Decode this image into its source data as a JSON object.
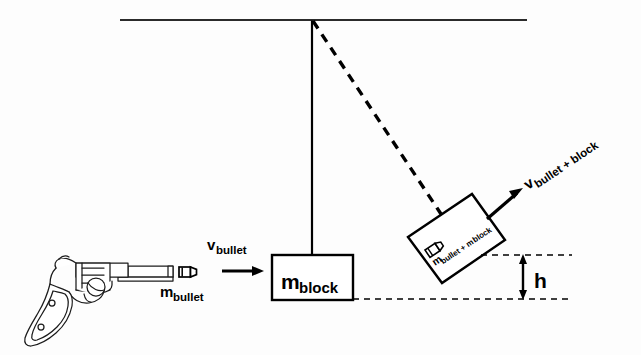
{
  "figure": {
    "background_color": "#fdfdfd",
    "ink_color": "#000000"
  },
  "labels": {
    "v_bullet": {
      "main": "v",
      "sub": "bullet"
    },
    "m_bullet": {
      "main": "m",
      "sub": "bullet"
    },
    "m_block": {
      "main": "m",
      "sub": "block"
    },
    "m_combined": {
      "main": "m",
      "sub": "bullet + m",
      "sub2": "block"
    },
    "v_combined": {
      "main": "v",
      "sub": "bullet + block"
    },
    "height": "h"
  },
  "icons": {
    "gun": "revolver-icon",
    "bullet_in_flight": "bullet-icon",
    "bullet_embedded": "bullet-embedded-icon",
    "velocity_arrow_horizontal": "arrow-right-icon",
    "velocity_arrow_diagonal": "arrow-diagonal-up-right-icon",
    "height_arrow": "double-arrow-vertical-icon"
  },
  "geometry": {
    "ceiling": {
      "x1": 120,
      "y1": 20,
      "x2": 527,
      "y2": 20,
      "stroke_width": 2.2
    },
    "pivot": {
      "x": 312,
      "y": 20
    },
    "string_rest": {
      "x1": 312,
      "y1": 20,
      "x2": 312,
      "y2": 256,
      "stroke_width": 2.2
    },
    "string_swung": {
      "x1": 312,
      "y1": 20,
      "x2": 441,
      "y2": 214,
      "dash": "9 7",
      "stroke_width": 3.2
    },
    "block_rest": {
      "x": 272,
      "y": 255,
      "w": 81,
      "h": 45,
      "stroke_width": 2.4
    },
    "block_swung": {
      "points": "408,237 472,194 505,240 442,283",
      "stroke_width": 2.4,
      "rotation_deg": -33.9
    },
    "dashed_line_upper": {
      "x1": 482,
      "y1": 255,
      "x2": 572,
      "y2": 255,
      "dash": "6 5"
    },
    "dashed_line_lower": {
      "x1": 353,
      "y1": 299,
      "x2": 572,
      "y2": 299,
      "dash": "6 5"
    },
    "height_arrow": {
      "x": 523,
      "y_top": 256,
      "y_bottom": 298
    },
    "horizontal_velocity_arrow": {
      "x1": 224,
      "y1": 271,
      "x2": 263,
      "y2": 271
    },
    "diagonal_velocity_arrow": {
      "x1": 489,
      "y1": 217,
      "x2": 522,
      "y2": 189
    },
    "bullet_in_flight": {
      "x": 180,
      "y": 267,
      "w": 17,
      "h": 11
    }
  },
  "text_positions": {
    "v_bullet": {
      "x": 208,
      "y": 252
    },
    "m_bullet": {
      "x": 160,
      "y": 297
    },
    "m_block": {
      "x": 281,
      "y": 287
    },
    "m_combined": {
      "x": 435,
      "y": 264,
      "rotation_deg": -33.9
    },
    "v_combined": {
      "x": 527,
      "y": 186,
      "rotation_deg": -33.9
    },
    "height": {
      "x": 534,
      "y": 287
    }
  }
}
